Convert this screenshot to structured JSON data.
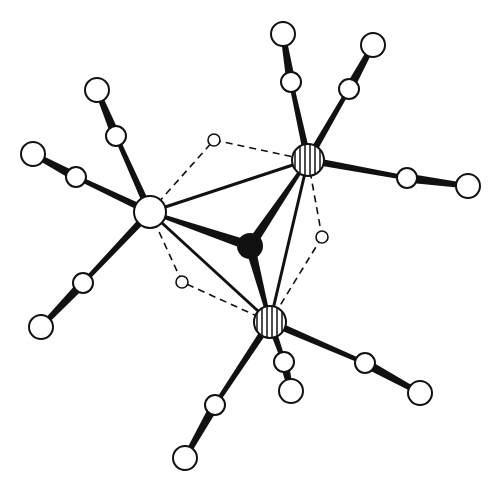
{
  "diagram": {
    "title": "",
    "colors": {
      "line": "#111111",
      "background": "#ffffff",
      "fill": "#ffffff",
      "solid": "#111111"
    },
    "metals": [
      {
        "id": "M1",
        "x": 150,
        "y": 212,
        "r": 16
      },
      {
        "id": "M2",
        "x": 308,
        "y": 160,
        "r": 16
      },
      {
        "id": "M3",
        "x": 270,
        "y": 322,
        "r": 16
      }
    ],
    "central_atom": {
      "id": "X",
      "x": 250,
      "y": 246,
      "r": 13
    },
    "hydrides": [
      {
        "id": "H1",
        "x": 214,
        "y": 140,
        "r": 6
      },
      {
        "id": "H2",
        "x": 322,
        "y": 237,
        "r": 6
      },
      {
        "id": "H3",
        "x": 182,
        "y": 282,
        "r": 6
      }
    ],
    "carbonyls": [
      {
        "metal": "M1",
        "c": [
          116,
          136
        ],
        "o": [
          97,
          90
        ]
      },
      {
        "metal": "M1",
        "c": [
          76,
          177
        ],
        "o": [
          33,
          154
        ]
      },
      {
        "metal": "M1",
        "c": [
          83,
          283
        ],
        "o": [
          41,
          327
        ]
      },
      {
        "metal": "M2",
        "c": [
          291,
          82
        ],
        "o": [
          283,
          34
        ]
      },
      {
        "metal": "M2",
        "c": [
          349,
          89
        ],
        "o": [
          373,
          45
        ]
      },
      {
        "metal": "M2",
        "c": [
          407,
          178
        ],
        "o": [
          468,
          186
        ]
      },
      {
        "metal": "M3",
        "c": [
          284,
          362
        ],
        "o": [
          291,
          391
        ]
      },
      {
        "metal": "M3",
        "c": [
          365,
          363
        ],
        "o": [
          420,
          393
        ]
      },
      {
        "metal": "M3",
        "c": [
          215,
          405
        ],
        "o": [
          185,
          458
        ]
      }
    ],
    "radii": {
      "carbon": 10,
      "oxygen": 12
    },
    "metal_metal_bonds": [
      [
        "M1",
        "M2"
      ],
      [
        "M2",
        "M3"
      ],
      [
        "M3",
        "M1"
      ]
    ],
    "dashed_bridges": [
      [
        "M1",
        "H1",
        "M2"
      ],
      [
        "M2",
        "H2",
        "M3"
      ],
      [
        "M3",
        "H3",
        "M1"
      ]
    ]
  }
}
